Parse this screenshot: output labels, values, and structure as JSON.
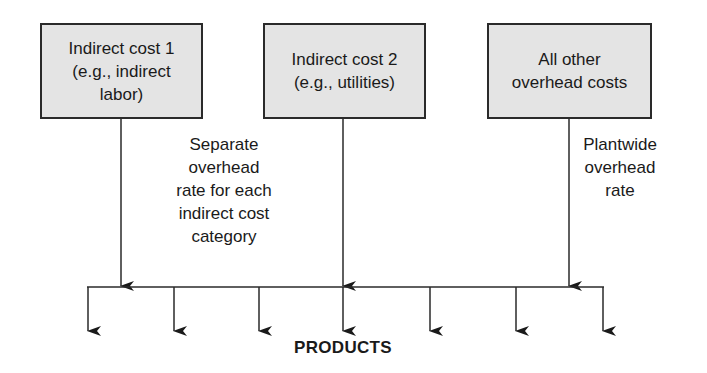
{
  "diagram": {
    "boxes": [
      {
        "id": "indirect-cost-1",
        "label": "Indirect cost 1\n(e.g., indirect\nlabor)"
      },
      {
        "id": "indirect-cost-2",
        "label": "Indirect cost 2\n(e.g., utilities)"
      },
      {
        "id": "all-other-overhead",
        "label": "All other\noverhead costs"
      }
    ],
    "annotations": {
      "separate_rate": "Separate\noverhead\nrate for each\nindirect cost\ncategory",
      "plantwide_rate": "Plantwide\noverhead\nrate"
    },
    "products_label": "PRODUCTS",
    "product_arrow_count": 7,
    "colors": {
      "box_fill": "#e4e4e4",
      "line": "#2a2a2a"
    }
  }
}
